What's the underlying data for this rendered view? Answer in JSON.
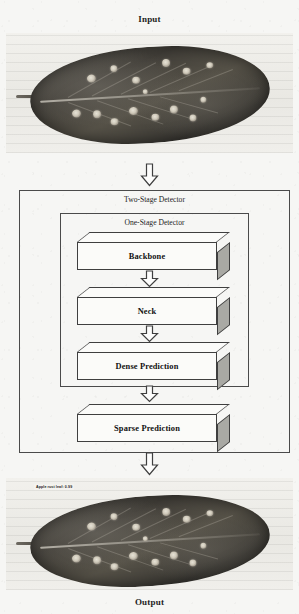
{
  "captions": {
    "input": "Input",
    "output": "Output"
  },
  "diagram": {
    "outer_frame_label": "Two-Stage Detector",
    "inner_frame_label": "One-Stage Detector",
    "stages": [
      {
        "id": "backbone",
        "label": "Backbone"
      },
      {
        "id": "neck",
        "label": "Neck"
      },
      {
        "id": "dense_prediction",
        "label": "Dense Prediction"
      },
      {
        "id": "sparse_prediction",
        "label": "Sparse Prediction"
      }
    ],
    "arrows": [
      {
        "id": "input-to-detector",
        "direction": "down"
      },
      {
        "id": "backbone-to-neck",
        "direction": "down"
      },
      {
        "id": "neck-to-dense",
        "direction": "down"
      },
      {
        "id": "dense-to-sparse",
        "direction": "down"
      },
      {
        "id": "detector-to-output",
        "direction": "down"
      }
    ]
  },
  "images": {
    "input": {
      "subject": "diseased apple leaf photograph",
      "alt": "Apple leaf with rust lesions on a scanned page background"
    },
    "output": {
      "subject": "diseased apple leaf photograph with detection annotation",
      "alt": "Same apple leaf with a predicted class label overlay",
      "detection_label": "Apple rust leaf: 0.99"
    }
  },
  "colors": {
    "background": "#f6f6f4",
    "line": "#4a4a4a",
    "box_face": "#fbfbf9",
    "box_side_shadow": "#a9a9a4",
    "text": "#111111",
    "leaf_dark": "#423f39",
    "lesion_light": "#e6e2d6"
  }
}
